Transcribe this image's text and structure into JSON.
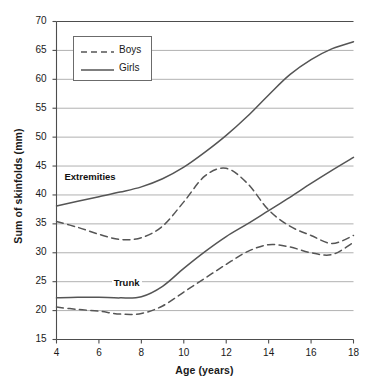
{
  "chart_data": {
    "type": "line",
    "title": "",
    "xlabel": "Age (years)",
    "ylabel": "Sum of skinfolds (mm)",
    "xlim": [
      4,
      18
    ],
    "ylim": [
      15,
      70
    ],
    "xticks": [
      4,
      6,
      8,
      10,
      12,
      14,
      16,
      18
    ],
    "yticks": [
      15,
      20,
      25,
      30,
      35,
      40,
      45,
      50,
      55,
      60,
      65,
      70
    ],
    "grid": "horizontal",
    "legend_position": "top-left",
    "legend": [
      {
        "name": "Boys",
        "style": "dashed"
      },
      {
        "name": "Girls",
        "style": "solid"
      }
    ],
    "annotations": [
      {
        "text": "Extremities",
        "x": 5.6,
        "y": 43.0
      },
      {
        "text": "Trunk",
        "x": 7.4,
        "y": 24.6
      }
    ],
    "x": [
      4,
      5,
      6,
      7,
      8,
      9,
      10,
      11,
      12,
      13,
      14,
      15,
      16,
      17,
      18
    ],
    "series": [
      {
        "name": "Girls Extremities",
        "group": "Extremities",
        "sex": "Girls",
        "style": "solid",
        "values": [
          38.1,
          38.9,
          39.7,
          40.5,
          41.4,
          42.8,
          44.8,
          47.4,
          50.3,
          53.6,
          57.3,
          60.8,
          63.4,
          65.3,
          66.5
        ]
      },
      {
        "name": "Boys Extremities",
        "group": "Extremities",
        "sex": "Boys",
        "style": "dashed",
        "values": [
          35.4,
          34.4,
          33.2,
          32.3,
          32.6,
          34.6,
          38.8,
          43.3,
          44.6,
          42.0,
          37.4,
          34.6,
          33.0,
          31.6,
          33.0
        ]
      },
      {
        "name": "Girls Trunk",
        "group": "Trunk",
        "sex": "Girls",
        "style": "solid",
        "values": [
          22.2,
          22.3,
          22.3,
          22.2,
          22.4,
          24.2,
          27.3,
          30.2,
          32.8,
          35.0,
          37.3,
          39.6,
          42.0,
          44.3,
          46.5
        ]
      },
      {
        "name": "Boys Trunk",
        "group": "Trunk",
        "sex": "Boys",
        "style": "dashed",
        "values": [
          20.6,
          20.2,
          19.9,
          19.4,
          19.5,
          20.8,
          23.2,
          25.6,
          28.0,
          30.2,
          31.4,
          31.0,
          30.0,
          29.7,
          31.8
        ]
      }
    ]
  },
  "axes": {
    "y_title": "Sum of skinfolds (mm)",
    "x_title": "Age (years)",
    "y_tick_labels": [
      "70",
      "65",
      "60",
      "55",
      "50",
      "45",
      "40",
      "35",
      "30",
      "25",
      "20",
      "15"
    ],
    "x_tick_labels": [
      "4",
      "6",
      "8",
      "10",
      "12",
      "14",
      "16",
      "18"
    ]
  },
  "legend": {
    "boys_label": "Boys",
    "girls_label": "Girls"
  },
  "annotations": {
    "extremities_label": "Extremities",
    "trunk_label": "Trunk"
  },
  "colors": {
    "line": "#555555",
    "grid": "#a8a8a8",
    "axis": "#4d4d4d",
    "text": "#1a1a1a",
    "background": "#ffffff"
  }
}
